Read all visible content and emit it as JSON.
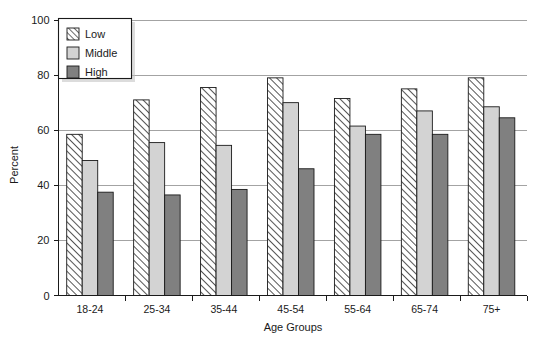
{
  "chart_data": {
    "type": "bar",
    "title": "",
    "xlabel": "Age Groups",
    "ylabel": "Percent",
    "categories": [
      "18-24",
      "25-34",
      "35-44",
      "45-54",
      "55-64",
      "65-74",
      "75+"
    ],
    "series": [
      {
        "name": "Low",
        "values": [
          58.5,
          71.0,
          75.5,
          79.0,
          71.5,
          75.0,
          79.0
        ]
      },
      {
        "name": "Middle",
        "values": [
          49.0,
          55.5,
          54.5,
          70.0,
          61.5,
          67.0,
          68.5
        ]
      },
      {
        "name": "High",
        "values": [
          37.5,
          36.5,
          38.5,
          46.0,
          58.5,
          58.5,
          64.5
        ]
      }
    ],
    "ylim": [
      0,
      100
    ],
    "yticks": [
      0,
      20,
      40,
      60,
      80,
      100
    ],
    "ytick_labels": [
      "0",
      "20",
      "40",
      "60",
      "80",
      "100"
    ],
    "grid": "horizontal",
    "legend_position": "top-left"
  },
  "legend": {
    "items": [
      {
        "label": "Low",
        "fill": "#ffffff",
        "pattern": "diagonal-hatch"
      },
      {
        "label": "Middle",
        "fill": "#d3d3d3",
        "pattern": "solid"
      },
      {
        "label": "High",
        "fill": "#808080",
        "pattern": "solid"
      }
    ]
  },
  "colors": {
    "low_fill": "#ffffff",
    "low_hatch": "#2b2b2b",
    "middle_fill": "#d3d3d3",
    "high_fill": "#808080",
    "outline": "#1a1a1a",
    "grid": "#8c8c8c",
    "background": "#ffffff"
  }
}
